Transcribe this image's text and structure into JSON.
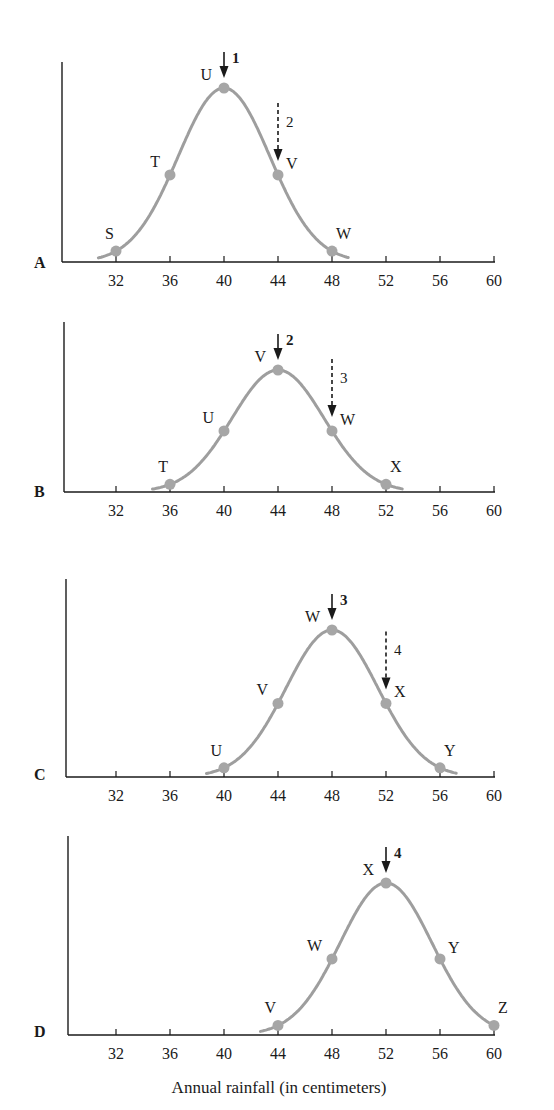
{
  "chart_data": [
    {
      "type": "line",
      "panel": "A",
      "title": "",
      "xlabel": "",
      "ylabel": "",
      "x_ticks": [
        32,
        36,
        40,
        44,
        48,
        52,
        56,
        60
      ],
      "xlim": [
        28,
        60
      ],
      "grid": false,
      "curve": {
        "mean": 40,
        "color": "#9e9e9e"
      },
      "points": [
        {
          "label": "S",
          "x": 32,
          "y": 0.05
        },
        {
          "label": "T",
          "x": 36,
          "y": 0.5
        },
        {
          "label": "U",
          "x": 40,
          "y": 1.0
        },
        {
          "label": "V",
          "x": 44,
          "y": 0.5
        },
        {
          "label": "W",
          "x": 48,
          "y": 0.05
        }
      ],
      "arrows": [
        {
          "label": "1",
          "x": 40,
          "style": "solid",
          "bold": true
        },
        {
          "label": "2",
          "x": 44,
          "style": "dashed",
          "bold": false
        }
      ]
    },
    {
      "type": "line",
      "panel": "B",
      "x_ticks": [
        32,
        36,
        40,
        44,
        48,
        52,
        56,
        60
      ],
      "xlim": [
        28,
        60
      ],
      "grid": false,
      "curve": {
        "mean": 44,
        "color": "#9e9e9e"
      },
      "points": [
        {
          "label": "T",
          "x": 36,
          "y": 0.05
        },
        {
          "label": "U",
          "x": 40,
          "y": 0.5
        },
        {
          "label": "V",
          "x": 44,
          "y": 1.0
        },
        {
          "label": "W",
          "x": 48,
          "y": 0.5
        },
        {
          "label": "X",
          "x": 52,
          "y": 0.05
        }
      ],
      "arrows": [
        {
          "label": "2",
          "x": 44,
          "style": "solid",
          "bold": true
        },
        {
          "label": "3",
          "x": 48,
          "style": "dashed",
          "bold": false
        }
      ]
    },
    {
      "type": "line",
      "panel": "C",
      "x_ticks": [
        32,
        36,
        40,
        44,
        48,
        52,
        56,
        60
      ],
      "xlim": [
        28,
        60
      ],
      "grid": false,
      "curve": {
        "mean": 48,
        "color": "#9e9e9e"
      },
      "points": [
        {
          "label": "U",
          "x": 40,
          "y": 0.05
        },
        {
          "label": "V",
          "x": 44,
          "y": 0.5
        },
        {
          "label": "W",
          "x": 48,
          "y": 1.0
        },
        {
          "label": "X",
          "x": 52,
          "y": 0.5
        },
        {
          "label": "Y",
          "x": 56,
          "y": 0.05
        }
      ],
      "arrows": [
        {
          "label": "3",
          "x": 48,
          "style": "solid",
          "bold": true
        },
        {
          "label": "4",
          "x": 52,
          "style": "dashed",
          "bold": false
        }
      ]
    },
    {
      "type": "line",
      "panel": "D",
      "xlabel": "Annual rainfall (in centimeters)",
      "x_ticks": [
        32,
        36,
        40,
        44,
        48,
        52,
        56,
        60
      ],
      "xlim": [
        28,
        60
      ],
      "grid": false,
      "curve": {
        "mean": 52,
        "color": "#9e9e9e"
      },
      "points": [
        {
          "label": "V",
          "x": 44,
          "y": 0.05
        },
        {
          "label": "W",
          "x": 48,
          "y": 0.5
        },
        {
          "label": "X",
          "x": 52,
          "y": 1.0
        },
        {
          "label": "Y",
          "x": 56,
          "y": 0.5
        },
        {
          "label": "Z",
          "x": 60,
          "y": 0.05
        }
      ],
      "arrows": [
        {
          "label": "4",
          "x": 52,
          "style": "solid",
          "bold": true
        }
      ]
    }
  ],
  "labels": {
    "xlabel": "Annual rainfall (in centimeters)",
    "panels": [
      "A",
      "B",
      "C",
      "D"
    ]
  },
  "colors": {
    "curve": "#9e9e9e",
    "point": "#a6a6a6",
    "axis": "#1a1a1a"
  }
}
